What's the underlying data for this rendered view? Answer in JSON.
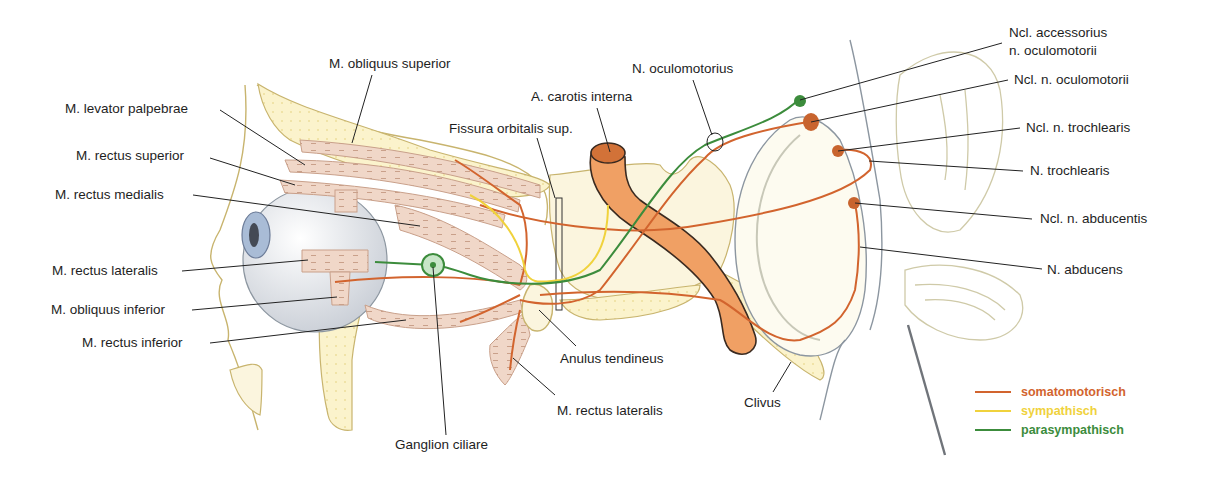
{
  "colors": {
    "somatomotorisch": "#d2642e",
    "sympathisch": "#f0d23c",
    "parasympathisch": "#3c8c3c",
    "muscle_fill": "#f0d7c8",
    "bone_fill": "#fbf3cc",
    "artery_fill": "#f0a064",
    "outline": "#c8b46e",
    "leader": "#222222"
  },
  "labels": {
    "obliquus_superior": "M. obliquus superior",
    "levator_palpebrae": "M. levator palpebrae",
    "rectus_superior": "M. rectus superior",
    "rectus_medialis": "M. rectus medialis",
    "rectus_lateralis_left": "M. rectus lateralis",
    "obliquus_inferior": "M. obliquus inferior",
    "rectus_inferior": "M. rectus inferior",
    "ganglion_ciliare": "Ganglion ciliare",
    "fissura": "Fissura orbitalis sup.",
    "carotis": "A. carotis interna",
    "oculomotorius": "N. oculomotorius",
    "anulus": "Anulus tendineus",
    "rectus_lateralis_bottom": "M. rectus lateralis",
    "clivus": "Clivus",
    "ncl_accessorius_1": "Ncl. accessorius",
    "ncl_accessorius_2": "n. oculomotorii",
    "ncl_oculomotorii": "Ncl. n. oculomotorii",
    "ncl_trochlearis": "Ncl. n. trochlearis",
    "n_trochlearis": "N. trochlearis",
    "ncl_abducentis": "Ncl. n. abducentis",
    "n_abducens": "N. abducens"
  },
  "legend": [
    {
      "label": "somatomotorisch",
      "color": "#d2642e"
    },
    {
      "label": "sympathisch",
      "color": "#f0d23c"
    },
    {
      "label": "parasympathisch",
      "color": "#3c8c3c"
    }
  ]
}
